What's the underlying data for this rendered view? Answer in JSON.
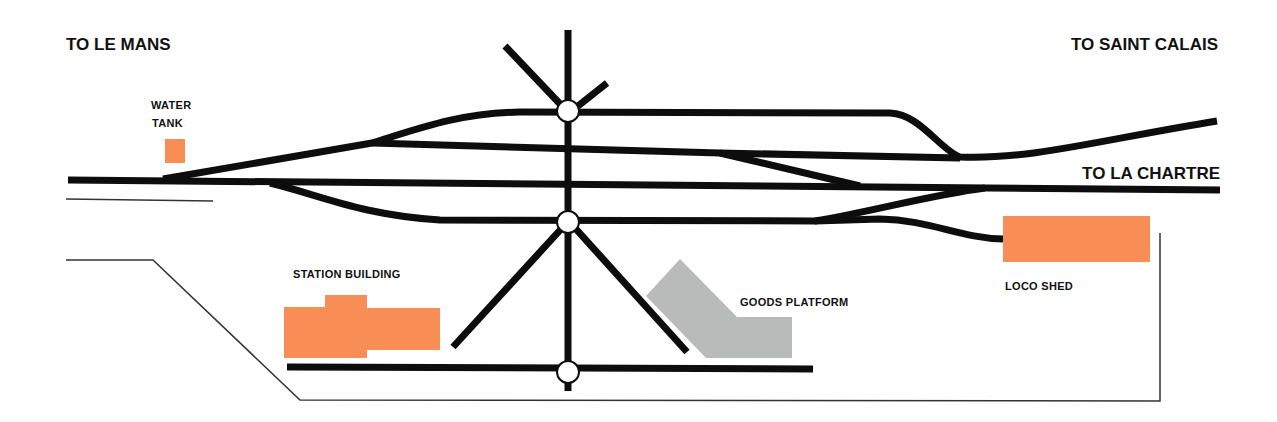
{
  "diagram": {
    "type": "railway-station-track-plan",
    "labels": {
      "to_le_mans": "TO LE MANS",
      "to_saint_calais": "TO SAINT CALAIS",
      "to_la_chartre": "TO LA CHARTRE",
      "water_tank_line1": "WATER",
      "water_tank_line2": "TANK",
      "station_building": "STATION BUILDING",
      "goods_platform": "GOODS PLATFORM",
      "loco_shed": "LOCO SHED"
    },
    "features": [
      {
        "id": "water-tank",
        "kind": "building",
        "color": "#f88e56"
      },
      {
        "id": "station-building",
        "kind": "building",
        "color": "#f88e56"
      },
      {
        "id": "loco-shed",
        "kind": "building",
        "color": "#f88e56"
      },
      {
        "id": "goods-platform",
        "kind": "platform",
        "color": "#b9bbba"
      },
      {
        "id": "turntable-top",
        "kind": "turntable"
      },
      {
        "id": "turntable-middle",
        "kind": "turntable"
      },
      {
        "id": "turntable-bottom",
        "kind": "turntable"
      }
    ],
    "colors": {
      "track": "#0d0d0d",
      "building": "#f88e56",
      "goods_platform": "#b9bbba",
      "background": "#ffffff"
    }
  }
}
